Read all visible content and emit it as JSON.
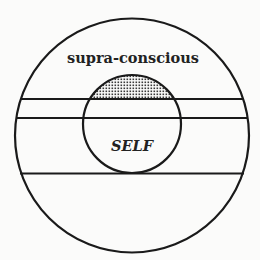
{
  "diagram": {
    "type": "concentric-regions",
    "outer_circle": {
      "cx": 132,
      "cy": 135.5,
      "r": 117
    },
    "inner_circle": {
      "cx": 132,
      "cy": 124,
      "r": 49,
      "label": "SELF"
    },
    "bands": [
      {
        "name": "supra-conscious",
        "label": "supra-conscious",
        "y_bottom": 99
      },
      {
        "name": "middle-band",
        "label": "",
        "y_top": 99,
        "y_bottom": 118
      },
      {
        "name": "center-band",
        "label": "",
        "y_top": 118,
        "y_bottom": 173
      },
      {
        "name": "lower-band",
        "label": "",
        "y_top": 173
      }
    ],
    "lines_y": [
      99,
      118,
      173
    ],
    "stippled_region": "inner-circle-cap-above-first-line",
    "colors": {
      "stroke": "#1a1a1a",
      "background": "#fbfbfa",
      "stipple": "#333333"
    }
  },
  "labels": {
    "supra": "supra-conscious",
    "self": "SELF"
  }
}
